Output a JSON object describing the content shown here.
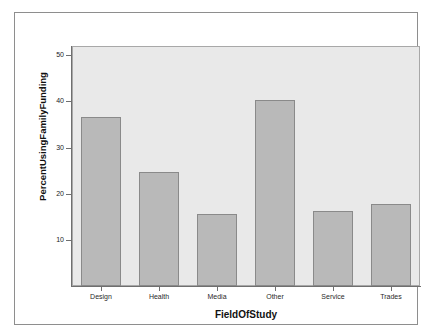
{
  "chart_data": {
    "type": "bar",
    "title": "",
    "xlabel": "FieldOfStudy",
    "ylabel": "PercentUsingFamilyFunding",
    "categories": [
      "Design",
      "Health",
      "Media",
      "Other",
      "Service",
      "Trades"
    ],
    "values": [
      36.7,
      24.6,
      15.5,
      40.3,
      16.3,
      17.8
    ],
    "ylim": [
      0,
      52
    ],
    "yticks": [
      10,
      20,
      30,
      40,
      50
    ],
    "ytick_labels": [
      "10",
      "20",
      "30",
      "40",
      "50"
    ],
    "grid": false,
    "legend": "none",
    "bar_fill": "#b9b9b9",
    "bar_border": "#8a8a8a",
    "plot_background": "#e9e9e9",
    "frame_border": "#8e8e8e"
  }
}
